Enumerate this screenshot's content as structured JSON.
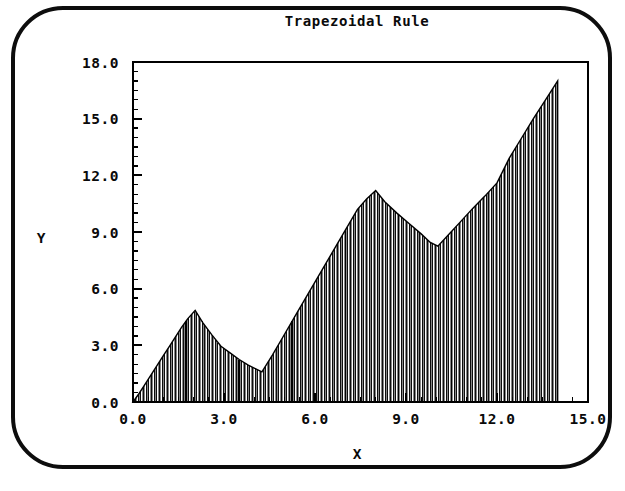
{
  "window": {
    "bezel_color": "#0d0d0d",
    "background_color": "#ffffff"
  },
  "chart_data": {
    "type": "area",
    "title": "Trapezoidal Rule",
    "xlabel": "X",
    "ylabel": "Y",
    "xlim": [
      0.0,
      15.0
    ],
    "ylim": [
      0.0,
      18.0
    ],
    "xticks": [
      "0.0",
      "3.0",
      "6.0",
      "9.0",
      "12.0",
      "15.0"
    ],
    "xtick_values": [
      0.0,
      3.0,
      6.0,
      9.0,
      12.0,
      15.0
    ],
    "yticks": [
      "0.0",
      "3.0",
      "6.0",
      "9.0",
      "12.0",
      "15.0",
      "18.0"
    ],
    "ytick_values": [
      0.0,
      3.0,
      6.0,
      9.0,
      12.0,
      15.0,
      18.0
    ],
    "x_minor_step": 0.5,
    "y_minor_step": 0.5,
    "grid": false,
    "legend": "none",
    "fill_style": "vertical-line-hatch",
    "fill_color": "#000000",
    "curve_color": "#000000",
    "x_domain_end": 14.0,
    "series": [
      {
        "name": "f(x)",
        "x": [
          0.0,
          0.2,
          0.4,
          0.6,
          0.8,
          1.0,
          1.2,
          1.4,
          1.6,
          1.8,
          2.05,
          2.3,
          2.6,
          2.9,
          3.2,
          3.5,
          3.8,
          4.25,
          4.6,
          5.0,
          5.4,
          5.8,
          6.2,
          6.6,
          7.0,
          7.4,
          7.7,
          8.0,
          8.3,
          8.7,
          9.1,
          9.5,
          9.8,
          10.05,
          10.4,
          10.8,
          11.2,
          11.6,
          12.0,
          12.4,
          12.8,
          13.2,
          13.6,
          14.0
        ],
        "y": [
          0.0,
          0.45,
          0.95,
          1.45,
          1.95,
          2.45,
          2.95,
          3.45,
          3.95,
          4.4,
          4.85,
          4.2,
          3.55,
          2.95,
          2.6,
          2.25,
          1.95,
          1.6,
          2.5,
          3.6,
          4.7,
          5.8,
          6.9,
          8.0,
          9.1,
          10.2,
          10.75,
          11.2,
          10.6,
          10.0,
          9.45,
          8.9,
          8.45,
          8.25,
          8.85,
          9.55,
          10.25,
          10.9,
          11.6,
          12.9,
          13.95,
          15.0,
          16.0,
          17.0
        ]
      }
    ],
    "num_trapezoids": 160
  },
  "geometry": {
    "plot_left": 133,
    "plot_right": 588,
    "plot_top": 62,
    "plot_bottom": 402,
    "title_x": 357,
    "title_y": 26,
    "xlabel_x": 357,
    "xlabel_y": 459,
    "ylabel_x": 41,
    "ylabel_y": 243
  }
}
